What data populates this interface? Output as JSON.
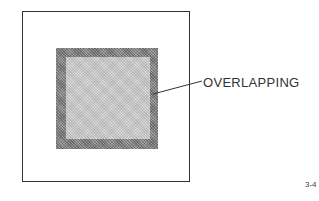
{
  "diagram": {
    "label": "OVERLAPPING",
    "figure_number": "3-4",
    "colors": {
      "outline": "#333333",
      "outer_square_fill": "#8a8a8a",
      "inner_square_fill": "#c8c8c8",
      "background": "#ffffff"
    }
  }
}
